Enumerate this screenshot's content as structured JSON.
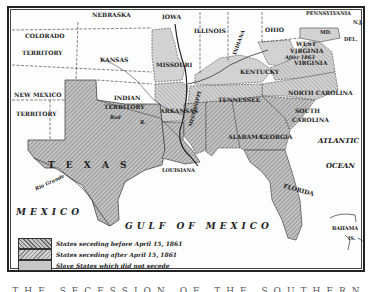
{
  "map": {
    "subject": "Secession of Southern States, 1860-1861",
    "colors": {
      "before_april_15": "#b8b8b8",
      "after_april_15": "#d6d6d6",
      "slave_not_seceded": "#e6e6e6",
      "free_territory": "#ffffff",
      "water": "#ffffff",
      "ink": "#222222"
    },
    "labels": {
      "nebraska": "NEBRASKA",
      "iowa": "IOWA",
      "illinois": "ILLINOIS",
      "indiana": "INDIANA",
      "ohio": "OHIO",
      "pennsylvania": "PENNSYLVANIA",
      "nj": "N.J.",
      "md": "MD.",
      "del": "DEL.",
      "colorado": "COLORADO",
      "colorado_territory": "TERRITORY",
      "kansas": "KANSAS",
      "missouri": "MISSOURI",
      "kentucky": "KENTUCKY",
      "west_virginia_1": "WEST",
      "west_virginia_2": "VIRGINIA",
      "west_virginia_3": "After 1863",
      "virginia": "VIRGINIA",
      "new_mexico": "NEW MEXICO",
      "new_mexico_territory": "TERRITORY",
      "indian": "INDIAN",
      "indian_territory": "TERRITORY",
      "red_river": "Red",
      "red_river_r": "R.",
      "arkansas": "ARKANSAS",
      "tennessee": "TENNESSEE",
      "north_carolina": "NORTH CAROLINA",
      "south": "SOUTH",
      "carolina": "CAROLINA",
      "mississippi": "MISSISSIPPI",
      "alabama": "ALABAMA",
      "georgia": "GEORGIA",
      "texas": "T  E  X  A  S",
      "louisiana": "LOUISIANA",
      "florida": "FLORIDA",
      "atlantic": "ATLANTIC",
      "ocean": "OCEAN",
      "mexico": "MEXICO",
      "gulf_of_mexico": "GULF  OF  MEXICO",
      "bahama": "BAHAMA",
      "is": "IS.",
      "rio_grande": "Rio Grande",
      "arkansas_river": "Arkansas R."
    },
    "legend": [
      {
        "label": "States seceding before April 15, 1861",
        "pattern": "before"
      },
      {
        "label": "States seceding after April 15, 1861",
        "pattern": "after"
      },
      {
        "label": "Slave States which did not secede",
        "pattern": "slave"
      }
    ],
    "caption": "THE SECESSION OF THE SOUTHERN STATES"
  }
}
